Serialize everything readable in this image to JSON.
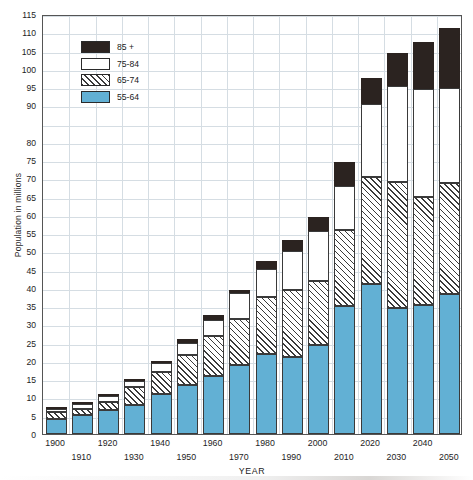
{
  "chart_data": {
    "type": "bar",
    "stacked": true,
    "title": "",
    "xlabel": "YEAR",
    "ylabel": "Population in millions",
    "ylim": [
      0,
      115
    ],
    "ytick_step": 5,
    "grid": true,
    "legend_position": "top-left",
    "categories": [
      "1900",
      "1910",
      "1920",
      "1930",
      "1940",
      "1950",
      "1960",
      "1970",
      "1980",
      "1990",
      "2000",
      "2010",
      "2020",
      "2030",
      "2040",
      "2050"
    ],
    "ytick_labels": [
      "0",
      "5",
      "10",
      "15",
      "20",
      "25",
      "30",
      "35",
      "40",
      "45",
      "50",
      "55",
      "60",
      "65",
      "70",
      "75",
      "80",
      "90",
      "95",
      "100",
      "105",
      "110",
      "115"
    ],
    "ytick_values": [
      0,
      5,
      10,
      15,
      20,
      25,
      30,
      35,
      40,
      45,
      50,
      55,
      60,
      65,
      70,
      75,
      80,
      90,
      95,
      100,
      105,
      110,
      115
    ],
    "gridline_values": [
      0,
      5,
      10,
      15,
      20,
      25,
      30,
      35,
      40,
      45,
      50,
      55,
      60,
      65,
      70,
      75,
      80,
      85,
      90,
      95,
      100,
      105,
      110,
      115
    ],
    "series": [
      {
        "name": "55-64",
        "color": "#62b0d4",
        "pattern": "solid",
        "values": [
          4.0,
          5.1,
          6.5,
          8.0,
          11.0,
          13.4,
          16.0,
          18.8,
          22.0,
          21.2,
          24.3,
          35.0,
          41.0,
          34.6,
          35.3,
          38.3
        ]
      },
      {
        "name": "65-74",
        "color": "#ffffff",
        "pattern": "diagonal-hatch",
        "values": [
          5.9,
          6.9,
          8.8,
          13.0,
          17.1,
          21.7,
          26.9,
          31.5,
          37.4,
          39.3,
          41.8,
          55.8,
          70.3,
          68.9,
          64.8,
          68.6
        ]
      },
      {
        "name": "75-84",
        "color": "#ffffff",
        "pattern": "solid",
        "values": [
          6.8,
          8.3,
          10.3,
          14.5,
          19.4,
          24.8,
          31.3,
          38.5,
          45.1,
          50.0,
          55.5,
          67.8,
          90.3,
          95.3,
          94.6,
          94.8
        ]
      },
      {
        "name": "85 +",
        "color": "#2b2320",
        "pattern": "solid",
        "values": [
          7.0,
          8.8,
          10.9,
          15.2,
          20.0,
          26.0,
          32.5,
          39.4,
          47.5,
          53.0,
          59.5,
          74.6,
          97.5,
          104.3,
          107.4,
          111.2
        ]
      }
    ],
    "cumulative_tops_note": "series values are cumulative stack tops in millions"
  },
  "legend": {
    "items": [
      {
        "label": "85 +",
        "swatch": "solid-black"
      },
      {
        "label": "75-84",
        "swatch": "solid-white"
      },
      {
        "label": "65-74",
        "swatch": "hatched"
      },
      {
        "label": "55-64",
        "swatch": "solid-blue"
      }
    ]
  },
  "axes": {
    "y_title": "Population in millions",
    "x_title": "YEAR"
  }
}
